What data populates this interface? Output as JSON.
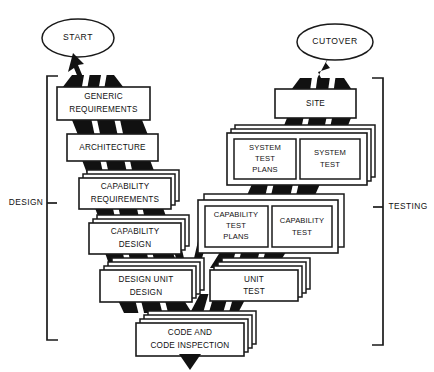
{
  "diagram": {
    "type": "flow-diagram",
    "background_color": "#ffffff",
    "line_color": "#1a1a1a",
    "fill_color": "#111111",
    "terminators": {
      "start": "START",
      "cutover": "CUTOVER"
    },
    "phase_labels": {
      "left": "DESIGN",
      "right": "TESTING"
    },
    "left_branch": [
      {
        "id": "generic-requirements",
        "lines": [
          "GENERIC",
          "REQUIREMENTS"
        ],
        "stack": 1
      },
      {
        "id": "architecture",
        "lines": [
          "ARCHITECTURE"
        ],
        "stack": 1
      },
      {
        "id": "capability-requirements",
        "lines": [
          "CAPABILITY",
          "REQUIREMENTS"
        ],
        "stack": 3
      },
      {
        "id": "capability-design",
        "lines": [
          "CAPABILITY",
          "DESIGN"
        ],
        "stack": 3
      },
      {
        "id": "design-unit-design",
        "lines": [
          "DESIGN UNIT",
          "DESIGN"
        ],
        "stack": 4
      }
    ],
    "right_branch": [
      {
        "id": "site",
        "lines": [
          "SITE"
        ],
        "stack": 1
      },
      {
        "id": "system-test-group",
        "stack": 3,
        "children": [
          {
            "id": "system-test-plans",
            "lines": [
              "SYSTEM",
              "TEST",
              "PLANS"
            ]
          },
          {
            "id": "system-test",
            "lines": [
              "SYSTEM",
              "TEST"
            ]
          }
        ]
      },
      {
        "id": "capability-test-group",
        "stack": 2,
        "children": [
          {
            "id": "capability-test-plans",
            "lines": [
              "CAPABILITY",
              "TEST",
              "PLANS"
            ]
          },
          {
            "id": "capability-test",
            "lines": [
              "CAPABILITY",
              "TEST"
            ]
          }
        ]
      },
      {
        "id": "unit-test",
        "lines": [
          "UNIT",
          "TEST"
        ],
        "stack": 4
      }
    ],
    "bottom": {
      "id": "code-and-code-inspection",
      "lines": [
        "CODE AND",
        "CODE INSPECTION"
      ],
      "stack": 4
    }
  }
}
